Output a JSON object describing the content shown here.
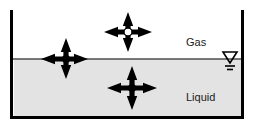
{
  "figure": {
    "colors": {
      "gas_fill": "#ffffff",
      "liquid_fill": "#e3e3e3",
      "wall": "#000000",
      "surface_line": "#4d4d4d",
      "arrow": "#000000",
      "molecule_liquid": "#000000",
      "molecule_gas_fill": "#ffffff",
      "molecule_gas_stroke": "#000000",
      "text": "#1a1a1a"
    },
    "container": {
      "left_wall_x": 13,
      "right_wall_x": 241,
      "bottom_y": 116,
      "top_y": 10,
      "wall_thickness": 3
    },
    "surface_line_y": 59
  },
  "regions": [
    {
      "id": "gas",
      "label": "Gas",
      "label_x": 186,
      "label_y": 46
    },
    {
      "id": "liquid",
      "label": "Liquid",
      "label_x": 186,
      "label_y": 101
    }
  ],
  "molecules": [
    {
      "id": "gas-molecule",
      "name": "gas-phase molecule",
      "cx": 128,
      "cy": 32,
      "center_style": "hollow",
      "center_radius": 4,
      "arrows": [
        {
          "dir": "up",
          "length": 20
        },
        {
          "dir": "down",
          "length": 20
        },
        {
          "dir": "left",
          "length": 24
        },
        {
          "dir": "right",
          "length": 24
        }
      ]
    },
    {
      "id": "surface-molecule",
      "name": "surface molecule",
      "cx": 66,
      "cy": 59,
      "center_style": "solid",
      "center_radius": 4,
      "arrows": [
        {
          "dir": "up",
          "length": 21
        },
        {
          "dir": "down",
          "length": 20
        },
        {
          "dir": "left",
          "length": 25
        },
        {
          "dir": "right",
          "length": 22
        }
      ]
    },
    {
      "id": "liquid-molecule",
      "name": "bulk liquid molecule",
      "cx": 132,
      "cy": 88,
      "center_style": "solid",
      "center_radius": 4,
      "arrows": [
        {
          "dir": "up",
          "length": 22
        },
        {
          "dir": "down",
          "length": 22
        },
        {
          "dir": "left",
          "length": 25
        },
        {
          "dir": "right",
          "length": 25
        }
      ]
    }
  ],
  "water_level_symbol": {
    "name": "water-level-symbol",
    "x": 230,
    "y": 52,
    "triangle_width": 14,
    "triangle_height": 11,
    "tick_lengths": [
      10,
      6
    ]
  }
}
